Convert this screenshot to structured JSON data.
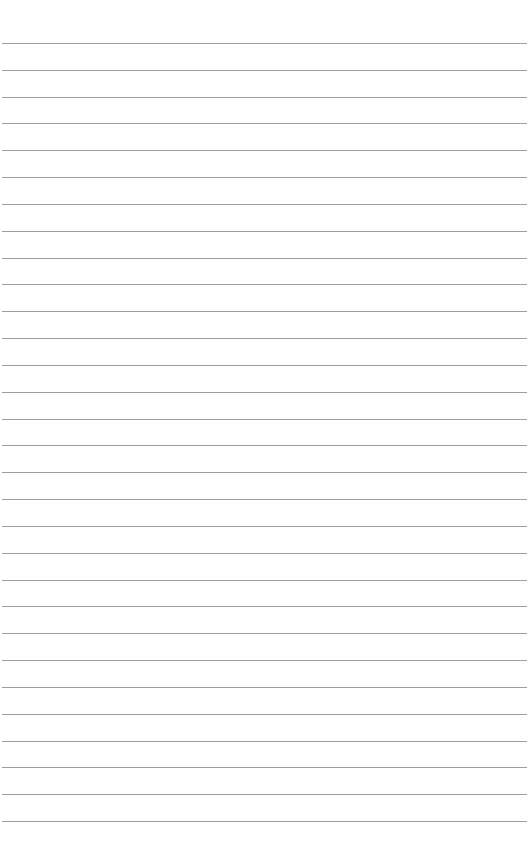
{
  "page": {
    "type": "lined-paper",
    "background_color": "#ffffff",
    "line_color": "#8c8c8c",
    "line_count": 30,
    "first_line_y": 43,
    "line_spacing": 26.83,
    "line_left": 2,
    "line_right": 527,
    "text": ""
  }
}
